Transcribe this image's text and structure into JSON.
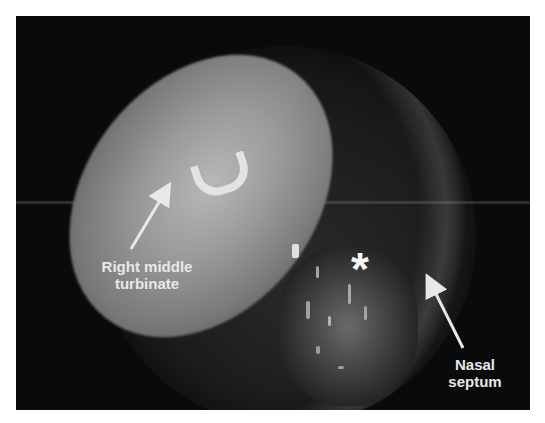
{
  "figure": {
    "type": "endoscopic photograph",
    "labels": {
      "turbinate": "Right middle turbinate",
      "turbinate_line1": "Right middle",
      "turbinate_line2": "turbinate",
      "septum_line1": "Nasal",
      "septum_line2": "septum",
      "marker": "*"
    },
    "colors": {
      "background": "#ffffff",
      "frame": "#0a0a0a",
      "annotation": "#e8e8e8"
    }
  }
}
